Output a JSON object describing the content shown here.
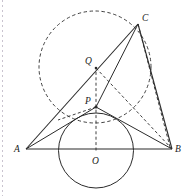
{
  "figure": {
    "canvas": {
      "width": 186,
      "height": 196
    },
    "stroke_color": "#2b2b2b",
    "label_color": "#1a1a1a",
    "background_color": "#ffffff",
    "margin_rule_color": "#c9c3cf"
  },
  "labels": {
    "A": "A",
    "B": "B",
    "C": "C",
    "O": "O",
    "P": "P",
    "Q": "Q"
  },
  "points": {
    "A": {
      "x": 26,
      "y": 149,
      "label_x": 14,
      "label_y": 152
    },
    "B": {
      "x": 172,
      "y": 149,
      "label_x": 175,
      "label_y": 152
    },
    "C": {
      "x": 138,
      "y": 24,
      "label_x": 142,
      "label_y": 21
    },
    "O": {
      "x": 96,
      "y": 150,
      "label_x": 92,
      "label_y": 163
    },
    "P": {
      "x": 96,
      "y": 107,
      "label_x": 85,
      "label_y": 104
    },
    "Q": {
      "x": 96,
      "y": 68,
      "label_x": 85,
      "label_y": 64
    }
  },
  "circles": {
    "incircle": {
      "cx": 96,
      "cy": 150.5,
      "r": 37.5,
      "style": "solid",
      "center_label": "O"
    },
    "dashed_circle": {
      "cx": 95,
      "cy": 67,
      "r": 56,
      "style": "dashed",
      "center_label": "Q"
    }
  },
  "segments": [
    {
      "name": "AB",
      "from": "A",
      "to": "B",
      "style": "solid"
    },
    {
      "name": "AC",
      "from": "A",
      "to": "C",
      "style": "solid"
    },
    {
      "name": "BC",
      "from": "B",
      "to": "C",
      "style": "solid"
    },
    {
      "name": "AP",
      "from": "A",
      "to": "P",
      "style": "solid"
    },
    {
      "name": "PB",
      "from": "P",
      "to": "B",
      "style": "solid"
    },
    {
      "name": "PC",
      "from": "P",
      "to": "C",
      "style": "solid"
    },
    {
      "name": "QB",
      "from": "Q",
      "to": "B",
      "style": "dashed"
    },
    {
      "name": "CB-inner",
      "from": "C",
      "to": "B",
      "style": "dashed"
    },
    {
      "name": "OQ-axis",
      "from": "O",
      "to": "Q",
      "style": "dashed"
    }
  ]
}
